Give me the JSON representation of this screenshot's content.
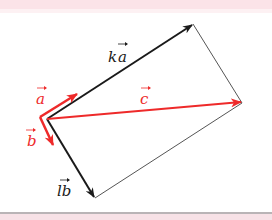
{
  "diagram": {
    "type": "vector-parallelogram-decomposition",
    "colors": {
      "red": "#ee2a2a",
      "black": "#1a1a1a",
      "outline": "#555555",
      "band": "#fbe3e8"
    },
    "labels": {
      "a": "a",
      "b": "b",
      "c": "c",
      "ka_k": "k",
      "ka_a": "a",
      "lb_l": "l",
      "lb_b": "b"
    },
    "vectors": [
      {
        "name": "a",
        "color": "red"
      },
      {
        "name": "b",
        "color": "red"
      },
      {
        "name": "c",
        "color": "red"
      },
      {
        "name": "ka",
        "color": "black"
      },
      {
        "name": "lb",
        "color": "black"
      }
    ]
  }
}
